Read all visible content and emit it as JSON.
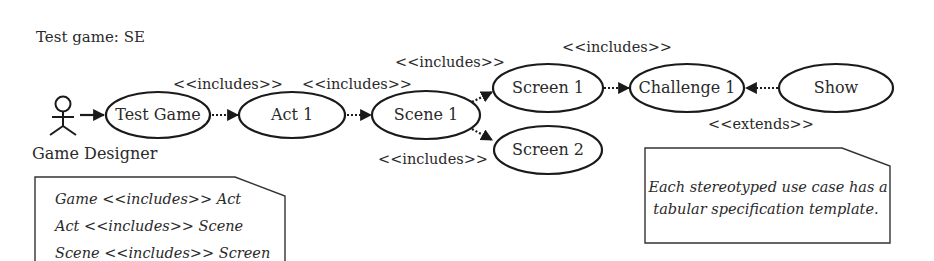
{
  "title": "Test game: SE",
  "actor": {
    "label": "Game Designer"
  },
  "use_cases": [
    {
      "id": "test-game",
      "label": "Test Game"
    },
    {
      "id": "act-1",
      "label": "Act 1"
    },
    {
      "id": "scene-1",
      "label": "Scene 1"
    },
    {
      "id": "screen-1",
      "label": "Screen 1"
    },
    {
      "id": "screen-2",
      "label": "Screen 2"
    },
    {
      "id": "challenge-1",
      "label": "Challenge 1"
    },
    {
      "id": "show",
      "label": "Show"
    }
  ],
  "relations": [
    {
      "from": "Game Designer",
      "to": "Test Game",
      "type": "association",
      "label": ""
    },
    {
      "from": "Test Game",
      "to": "Act 1",
      "type": "include",
      "label": "<<includes>>"
    },
    {
      "from": "Act 1",
      "to": "Scene 1",
      "type": "include",
      "label": "<<includes>>"
    },
    {
      "from": "Scene 1",
      "to": "Screen 1",
      "type": "include",
      "label": "<<includes>>"
    },
    {
      "from": "Scene 1",
      "to": "Screen 2",
      "type": "include",
      "label": "<<includes>>"
    },
    {
      "from": "Screen 1",
      "to": "Challenge 1",
      "type": "include",
      "label": "<<includes>>"
    },
    {
      "from": "Show",
      "to": "Challenge 1",
      "type": "extend",
      "label": "<<extends>>"
    }
  ],
  "notes": {
    "left": {
      "lines": [
        "Game <<includes>> Act",
        "Act <<includes>> Scene",
        "Scene <<includes>> Screen"
      ]
    },
    "right": {
      "lines": [
        "Each stereotyped use case has a",
        "tabular specification template."
      ]
    }
  }
}
